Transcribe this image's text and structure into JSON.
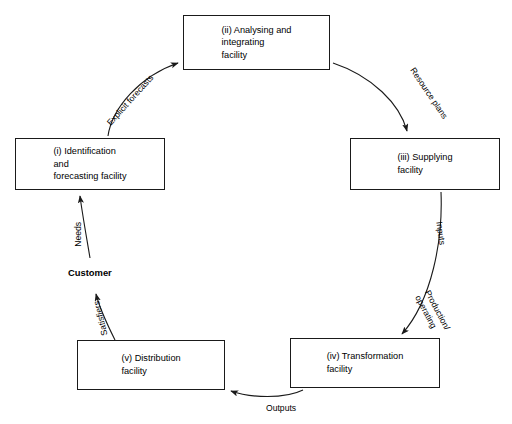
{
  "diagram": {
    "type": "cyclical-process-flow",
    "background_color": "#ffffff",
    "stroke_color": "#1a1a1a",
    "nodes": [
      {
        "id": "analysing",
        "label": "(ii)  Analysing and\n       integrating\n       facility",
        "x": 183,
        "y": 15,
        "w": 147,
        "h": 55
      },
      {
        "id": "identification",
        "label": "(i)  Identification\n      and\n      forecasting facility",
        "x": 15,
        "y": 138,
        "w": 150,
        "h": 52
      },
      {
        "id": "supplying",
        "label": "(iii)  Supplying\n        facility",
        "x": 350,
        "y": 138,
        "w": 150,
        "h": 52
      },
      {
        "id": "transformation",
        "label": "(iv)  Transformation\n        facility",
        "x": 290,
        "y": 338,
        "w": 150,
        "h": 50
      },
      {
        "id": "distribution",
        "label": "(v)  Distribution\n       facility",
        "x": 77,
        "y": 340,
        "w": 148,
        "h": 50
      }
    ],
    "edges": [
      {
        "id": "explicit-forecasts",
        "label": "Explicit forecasts",
        "from": "identification",
        "to": "analysing",
        "label_x": 98,
        "label_y": 95,
        "rotate": -48
      },
      {
        "id": "resource-plans",
        "label": "Resource plans",
        "from": "analysing",
        "to": "supplying",
        "label_x": 399,
        "label_y": 88,
        "rotate": 56
      },
      {
        "id": "inputs",
        "label": "Inputs",
        "from": "supplying",
        "to": "transformation",
        "label_x": 429,
        "label_y": 228,
        "rotate": 82
      },
      {
        "id": "production-operating",
        "label": "Production/\noperating",
        "from": "supplying",
        "to": "transformation",
        "label_x": 411,
        "label_y": 302,
        "rotate": 62
      },
      {
        "id": "outputs",
        "label": "Outputs",
        "from": "transformation",
        "to": "distribution",
        "label_x": 266,
        "label_y": 403,
        "rotate": 0
      },
      {
        "id": "satisfiers",
        "label": "Satisfiers",
        "from": "distribution",
        "to": "customer",
        "label_x": 83,
        "label_y": 313,
        "rotate": -104
      },
      {
        "id": "needs",
        "label": "Needs",
        "from": "customer",
        "to": "identification",
        "label_x": 66,
        "label_y": 229,
        "rotate": -90
      }
    ],
    "annotations": [
      {
        "id": "customer",
        "label": "Customer",
        "x": 68,
        "y": 267
      }
    ]
  }
}
